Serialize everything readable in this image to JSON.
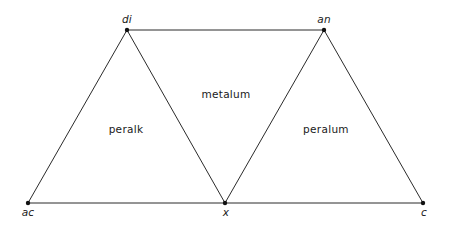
{
  "diagram": {
    "canvas": {
      "width": 451,
      "height": 232,
      "background": "#ffffff"
    },
    "style": {
      "line_color": "#2b2b2b",
      "vertex_color": "#111111",
      "text_color": "#1a1a1a",
      "line_width": 1,
      "vertex_radius": 2.2
    },
    "vertices": [
      {
        "id": "di",
        "label": "di",
        "x": 127,
        "y": 30,
        "label_x": 127,
        "label_y": 23,
        "label_anchor": "middle",
        "italic": true
      },
      {
        "id": "an",
        "label": "an",
        "x": 324,
        "y": 30,
        "label_x": 324,
        "label_y": 23,
        "label_anchor": "middle",
        "italic": true
      },
      {
        "id": "ac",
        "label": "ac",
        "x": 28,
        "y": 203,
        "label_x": 28,
        "label_y": 216,
        "label_anchor": "middle",
        "italic": true
      },
      {
        "id": "x",
        "label": "x",
        "x": 225,
        "y": 203,
        "label_x": 226,
        "label_y": 216,
        "label_anchor": "middle",
        "italic": true
      },
      {
        "id": "c",
        "label": "c",
        "x": 423,
        "y": 203,
        "label_x": 424,
        "label_y": 216,
        "label_anchor": "middle",
        "italic": true
      }
    ],
    "edges": [
      {
        "id": "edge-di-an",
        "from": "di",
        "to": "an",
        "x1": 127,
        "y1": 30,
        "x2": 324,
        "y2": 30
      },
      {
        "id": "edge-ac-x",
        "from": "ac",
        "to": "x",
        "x1": 28,
        "y1": 203,
        "x2": 225,
        "y2": 203
      },
      {
        "id": "edge-x-c",
        "from": "x",
        "to": "c",
        "x1": 225,
        "y1": 203,
        "x2": 423,
        "y2": 203
      },
      {
        "id": "edge-ac-di",
        "from": "ac",
        "to": "di",
        "x1": 28,
        "y1": 203,
        "x2": 127,
        "y2": 30
      },
      {
        "id": "edge-di-x",
        "from": "di",
        "to": "x",
        "x1": 127,
        "y1": 30,
        "x2": 225,
        "y2": 203
      },
      {
        "id": "edge-x-an",
        "from": "x",
        "to": "an",
        "x1": 225,
        "y1": 203,
        "x2": 324,
        "y2": 30
      },
      {
        "id": "edge-an-c",
        "from": "an",
        "to": "c",
        "x1": 324,
        "y1": 30,
        "x2": 423,
        "y2": 203
      }
    ],
    "regions": [
      {
        "id": "region-peralk",
        "label": "peralk",
        "x": 126,
        "y": 133
      },
      {
        "id": "region-metalum",
        "label": "metalum",
        "x": 226,
        "y": 98
      },
      {
        "id": "region-peralum",
        "label": "peralum",
        "x": 326,
        "y": 133
      }
    ]
  }
}
